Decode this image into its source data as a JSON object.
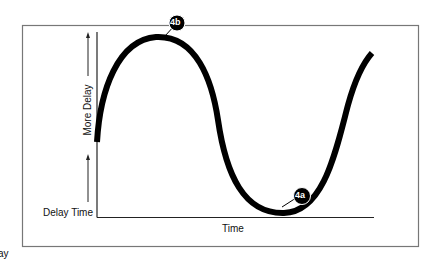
{
  "diagram": {
    "y_axis": {
      "label": "More Delay",
      "baseline_label": "Delay Time"
    },
    "x_axis": {
      "label": "Time"
    },
    "markers": [
      {
        "id": "4b",
        "label": "4b",
        "position": "peak"
      },
      {
        "id": "4a",
        "label": "4a",
        "position": "trough"
      }
    ],
    "clipped_text": "ay",
    "colors": {
      "curve": "#000000",
      "frame": "#777777",
      "badge_fill": "#000000",
      "badge_text": "#ffffff",
      "background": "#ffffff"
    }
  }
}
